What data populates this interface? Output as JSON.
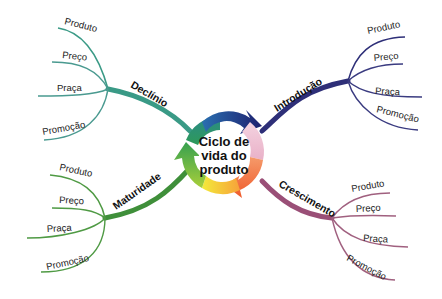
{
  "diagram": {
    "title": "Ciclo de vida do produto",
    "center_lines": [
      "Ciclo de",
      "vida do",
      "produto"
    ],
    "branches": [
      {
        "id": "introducao",
        "label": "Introdução",
        "color": "#2e2f78",
        "leaves": [
          "Produto",
          "Preço",
          "Praça",
          "Promoção"
        ]
      },
      {
        "id": "crescimento",
        "label": "Crescimento",
        "color": "#9a4f77",
        "leaves": [
          "Produto",
          "Preço",
          "Praça",
          "Promoção"
        ]
      },
      {
        "id": "maturidade",
        "label": "Maturidade",
        "color": "#3f8f3a",
        "leaves": [
          "Produto",
          "Preço",
          "Praça",
          "Promoção"
        ]
      },
      {
        "id": "declinio",
        "label": "Declínio",
        "color": "#3a9a86",
        "leaves": [
          "Produto",
          "Preço",
          "Praça",
          "Promoção"
        ]
      }
    ],
    "ring_colors": [
      "#1d1f6e",
      "#f2c6d6",
      "#f37a3a",
      "#f5e23a",
      "#8cc63f",
      "#2b9a5a",
      "#2a8a8a"
    ]
  }
}
